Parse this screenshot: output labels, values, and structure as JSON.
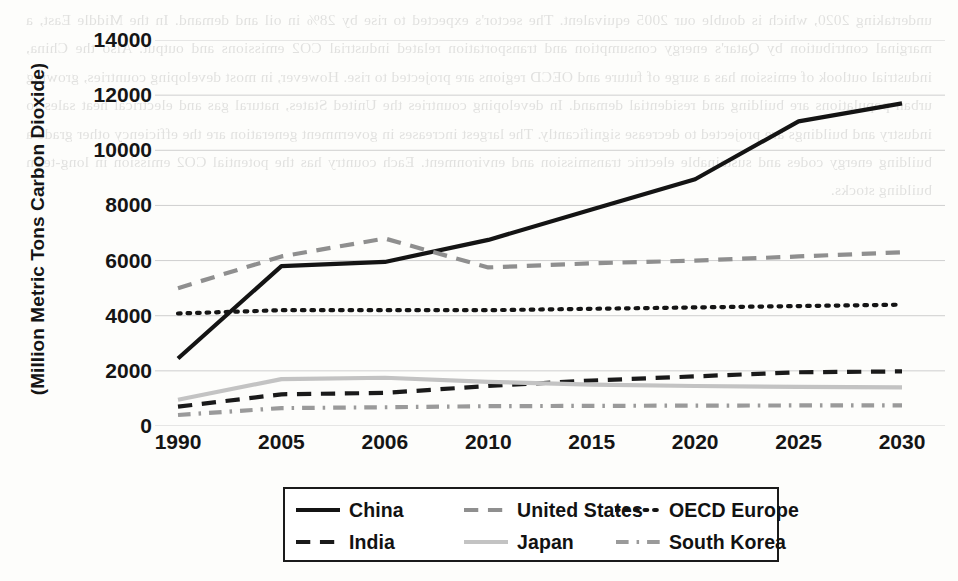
{
  "chart_data": {
    "type": "line",
    "title": "",
    "xlabel": "",
    "ylabel": "(Million Metric Tons Carbon Dioxide)",
    "categories": [
      "1990",
      "2005",
      "2006",
      "2010",
      "2015",
      "2020",
      "2025",
      "2030"
    ],
    "ylim": [
      0,
      14000
    ],
    "ytick_values": [
      0,
      2000,
      4000,
      6000,
      8000,
      10000,
      12000,
      14000
    ],
    "ytick_labels": [
      "0",
      "2000",
      "4000",
      "6000",
      "8000",
      "10000",
      "12000",
      "14000"
    ],
    "grid": true,
    "legend_position": "below-center",
    "series": [
      {
        "name": "China",
        "style": "solid",
        "color": "#141414",
        "width": 4.2,
        "values": [
          2450,
          5800,
          5950,
          6750,
          7850,
          8950,
          11050,
          11700
        ]
      },
      {
        "name": "United States",
        "style": "dashed",
        "color": "#8f8f8f",
        "width": 4.2,
        "values": [
          5000,
          6150,
          6800,
          5750,
          5900,
          6000,
          6150,
          6300
        ]
      },
      {
        "name": "OECD Europe",
        "style": "dotted",
        "color": "#151515",
        "width": 4.2,
        "values": [
          4080,
          4200,
          4200,
          4200,
          4250,
          4300,
          4350,
          4400
        ]
      },
      {
        "name": "India",
        "style": "dashed",
        "color": "#1a1a1a",
        "width": 4.2,
        "values": [
          700,
          1150,
          1200,
          1450,
          1650,
          1800,
          1950,
          1980
        ]
      },
      {
        "name": "Japan",
        "style": "solid",
        "color": "#c3c3c3",
        "width": 4.2,
        "values": [
          950,
          1700,
          1750,
          1600,
          1500,
          1450,
          1420,
          1400
        ]
      },
      {
        "name": "South Korea",
        "style": "dashdot",
        "color": "#9a9a9a",
        "width": 4.2,
        "values": [
          400,
          650,
          680,
          720,
          730,
          740,
          745,
          750
        ]
      }
    ]
  },
  "legend": {
    "items": [
      {
        "label": "China",
        "style": "solid",
        "color": "#141414"
      },
      {
        "label": "United States",
        "style": "dashed",
        "color": "#8f8f8f"
      },
      {
        "label": "OECD Europe",
        "style": "dotted",
        "color": "#151515"
      },
      {
        "label": "India",
        "style": "dashed",
        "color": "#1a1a1a"
      },
      {
        "label": "Japan",
        "style": "solid",
        "color": "#c3c3c3"
      },
      {
        "label": "South Korea",
        "style": "dashdot",
        "color": "#9a9a9a"
      }
    ]
  },
  "background_text": "undertaking 2020, which is double our 2005 equivalent. The sector's expected to rise by 28% in oil and demand. In the Middle East, a marginal contribution by Qatar's energy consumption and transportation related industrial CO2 emissions and output. Also the China, industrial outlook of emission has a surge of future and OECD regions are projected to rise. However, in most developing countries, growing urban populations are building and residential demand. In developing countries the United States, natural gas and electrical heat sales to industry and buildings are projected to decrease significantly. The largest increases in government generation are the efficiency other grade a building energy codes and sustainable electric transmission and environment. Each country has the potential CO2 emission in long-term building stocks."
}
